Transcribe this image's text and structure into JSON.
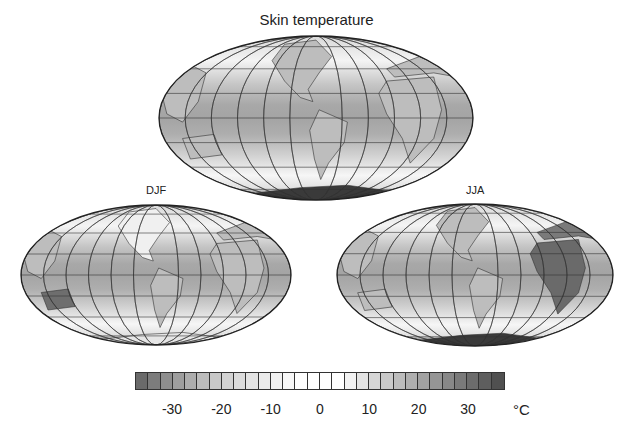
{
  "chart_data": {
    "type": "heatmap",
    "title": "Skin temperature",
    "projection": "Hammer/Mollweide global map",
    "panels": [
      {
        "name": "Annual",
        "label": "",
        "cx": 316,
        "cy": 118,
        "rx": 157,
        "ry": 82
      },
      {
        "name": "DJF",
        "label": "DJF",
        "cx": 156,
        "cy": 275,
        "rx": 135,
        "ry": 70
      },
      {
        "name": "JJA",
        "label": "JJA",
        "cx": 475,
        "cy": 275,
        "rx": 138,
        "ry": 71
      }
    ],
    "colorbar": {
      "min": -37.5,
      "max": 37.5,
      "step": 2.5,
      "ticks": [
        -30,
        -20,
        -10,
        0,
        10,
        20,
        30
      ],
      "unit": "°C",
      "colors": [
        "#6a6a6a",
        "#7c7c7c",
        "#8e8e8e",
        "#9e9e9e",
        "#adadad",
        "#bcbcbc",
        "#c8c8c8",
        "#d3d3d3",
        "#dcdcdc",
        "#e4e4e4",
        "#ebebeb",
        "#f2f2f2",
        "#f8f8f8",
        "#ffffff",
        "#ffffff",
        "#ffffff",
        "#ffffff",
        "#f2f2f2",
        "#e4e4e4",
        "#d6d6d6",
        "#c9c9c9",
        "#bcbcbc",
        "#afafaf",
        "#a2a2a2",
        "#959595",
        "#888888",
        "#7a7a7a",
        "#6c6c6c",
        "#5e5e5e",
        "#505050"
      ]
    }
  },
  "labels": {
    "title": "Skin temperature",
    "djf": "DJF",
    "jja": "JJA",
    "unit": "°C",
    "ticks": [
      "-30",
      "-20",
      "-10",
      "0",
      "10",
      "20",
      "30"
    ]
  }
}
